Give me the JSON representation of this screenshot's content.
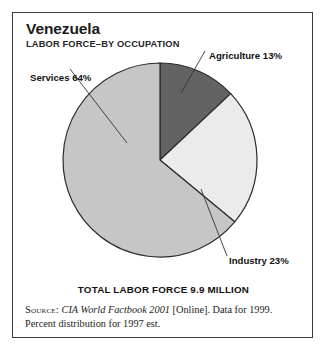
{
  "figure": {
    "title": "Venezuela",
    "subtitle": "LABOR FORCE–BY OCCUPATION",
    "total_caption": "TOTAL LABOR FORCE 9.9 MILLION",
    "source": {
      "keyword": "Source:",
      "work": "CIA World Factbook 2001",
      "rest": " [Online]. Data for 1999. Percent distribution for 1997 est."
    },
    "border_color": "#3a3a3a"
  },
  "labels": {
    "services": "Services 64%",
    "agriculture": "Agriculture 13%",
    "industry": "Industry 23%"
  },
  "chart_data": {
    "type": "pie",
    "subtitle": "LABOR FORCE–BY OCCUPATION",
    "categories": [
      "Agriculture",
      "Industry",
      "Services"
    ],
    "values": [
      13,
      23,
      64
    ],
    "unit": "percent",
    "total_label": "TOTAL LABOR FORCE 9.9 MILLION",
    "total_value": 9.9,
    "total_unit": "million workers",
    "start_angle_deg": 0,
    "direction": "clockwise",
    "colors": [
      "#636363",
      "#ebebeb",
      "#c6c6c6"
    ],
    "slice_outline_color": "#2b2b2b",
    "legend": "none",
    "labels_inline": [
      "Agriculture 13%",
      "Industry 23%",
      "Services 64%"
    ],
    "grid": false
  }
}
